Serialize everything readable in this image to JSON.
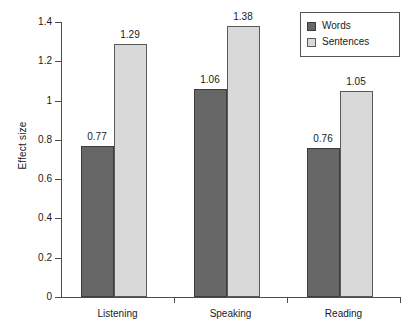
{
  "chart_data": {
    "type": "bar",
    "title": "",
    "xlabel": "",
    "ylabel": "Effect size",
    "ylim": [
      0,
      1.4
    ],
    "yticks": [
      "0",
      "0.2",
      "0.4",
      "0.6",
      "0.8",
      "1",
      "1.2",
      "1.4"
    ],
    "ytick_values": [
      0,
      0.2,
      0.4,
      0.6,
      0.8,
      1,
      1.2,
      1.4
    ],
    "grid": false,
    "legend_position": "top-right",
    "categories": [
      "Listening",
      "Speaking",
      "Reading"
    ],
    "series": [
      {
        "name": "Words",
        "color": "#676767",
        "values": [
          0.77,
          1.06,
          0.76
        ],
        "labels": [
          "0.77",
          "1.06",
          "0.76"
        ]
      },
      {
        "name": "Sentences",
        "color": "#d9d9d9",
        "values": [
          1.29,
          1.38,
          1.05
        ],
        "labels": [
          "1.29",
          "1.38",
          "1.05"
        ]
      }
    ]
  },
  "legend": {
    "entries": [
      {
        "label": "Words",
        "swatch": "words"
      },
      {
        "label": "Sentences",
        "swatch": "sentences"
      }
    ]
  },
  "colors": {
    "words": "#676767",
    "sentences": "#d9d9d9",
    "axis": "#4d4d4d",
    "text": "#1a1a1a",
    "background": "#ffffff"
  }
}
